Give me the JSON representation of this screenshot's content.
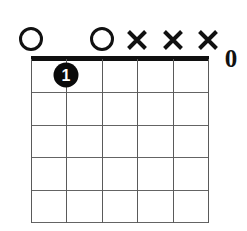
{
  "diagram": {
    "type": "guitar-chord-diagram",
    "orientation": "vertical",
    "string_count": 6,
    "fret_count": 5,
    "starting_fret": 1,
    "has_nut": true,
    "colors": {
      "ink": "#101010",
      "grid": "#5a5a5a",
      "background": "#ffffff",
      "dot_fill": "#0a0a0a",
      "dot_text": "#ffffff"
    },
    "geometry": {
      "grid_left": 31,
      "grid_right": 208,
      "grid_top": 59,
      "grid_bottom": 222,
      "string_spacing": 35.4,
      "fret_spacing": 32.6,
      "marker_row_y": 39,
      "nut_thickness": 5
    },
    "strings": [
      {
        "index": 1,
        "x": 31,
        "marker": "open",
        "marker_glyph": "O"
      },
      {
        "index": 2,
        "x": 66,
        "marker": "none",
        "marker_glyph": ""
      },
      {
        "index": 3,
        "x": 102,
        "marker": "open",
        "marker_glyph": "O"
      },
      {
        "index": 4,
        "x": 137,
        "marker": "muted",
        "marker_glyph": "X"
      },
      {
        "index": 5,
        "x": 173,
        "marker": "muted",
        "marker_glyph": "X"
      },
      {
        "index": 6,
        "x": 208,
        "marker": "muted",
        "marker_glyph": "X"
      }
    ],
    "fret_lines_y": [
      59,
      92,
      125,
      157,
      190,
      222
    ],
    "fingerings": [
      {
        "finger_label": "1",
        "string_index": 2,
        "fret": 1,
        "x": 66,
        "y": 75
      }
    ],
    "corner_glyph": {
      "text": "0",
      "x": 231,
      "y": 58
    }
  }
}
